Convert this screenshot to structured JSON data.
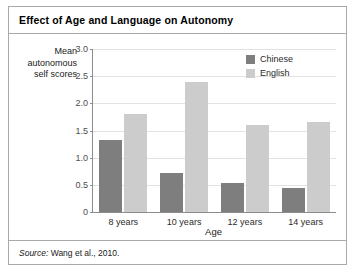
{
  "figure": {
    "title": "Effect of Age and Language on Autonomy",
    "source_label": "Source:",
    "source_text": "Wang et al., 2010."
  },
  "colors": {
    "series_chinese": "#7e7e7e",
    "series_english": "#cccccc",
    "axis": "#8c8c8c",
    "grid": "#e2e2e2",
    "frame": "#a9a9a9"
  },
  "chart_data": {
    "type": "bar",
    "title": "Effect of Age and Language on Autonomy",
    "xlabel": "Age",
    "ylabel": "Mean autonomous self scores",
    "ylabel_lines": [
      "Mean",
      "autonomous",
      "self scores"
    ],
    "categories": [
      "8 years",
      "10 years",
      "12 years",
      "14 years"
    ],
    "series": [
      {
        "name": "Chinese",
        "color": "#7e7e7e",
        "values": [
          1.33,
          0.72,
          0.54,
          0.44
        ]
      },
      {
        "name": "English",
        "color": "#cccccc",
        "values": [
          1.8,
          2.4,
          1.6,
          1.65
        ]
      }
    ],
    "ylim": [
      0,
      3.0
    ],
    "yticks": [
      0,
      0.5,
      1.0,
      1.5,
      2.0,
      2.5,
      3.0
    ],
    "ytick_labels": [
      "0",
      "0.5",
      "1.0",
      "1.5",
      "2.0",
      "2.5",
      "3.0"
    ],
    "grid": true,
    "grid_axis": "y",
    "legend": [
      "Chinese",
      "English"
    ],
    "legend_position": "top-right-inside"
  }
}
